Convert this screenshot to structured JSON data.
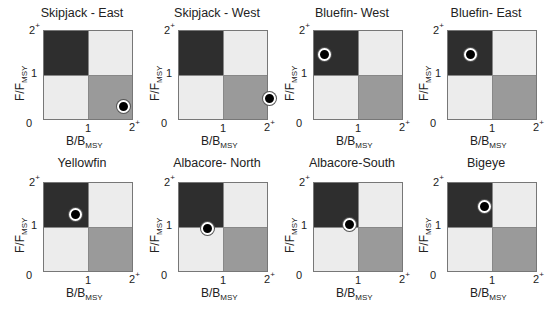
{
  "chart_data": [
    {
      "type": "scatter",
      "title": "Skipjack - East",
      "xlabel": "B/B_MSY",
      "ylabel": "F/F_MSY",
      "xlim": [
        0,
        2
      ],
      "ylim": [
        0,
        2
      ],
      "x": [
        1.76
      ],
      "y": [
        0.33
      ]
    },
    {
      "type": "scatter",
      "title": "Skipjack - West",
      "xlabel": "B/B_MSY",
      "ylabel": "F/F_MSY",
      "xlim": [
        0,
        2
      ],
      "ylim": [
        0,
        2
      ],
      "x": [
        2.0
      ],
      "y": [
        0.49
      ]
    },
    {
      "type": "scatter",
      "title": "Bluefin- West",
      "xlabel": "B/B_MSY",
      "ylabel": "F/F_MSY",
      "xlim": [
        0,
        2
      ],
      "ylim": [
        0,
        2
      ],
      "x": [
        0.24
      ],
      "y": [
        1.47
      ]
    },
    {
      "type": "scatter",
      "title": "Bluefin- East",
      "xlabel": "B/B_MSY",
      "ylabel": "F/F_MSY",
      "xlim": [
        0,
        2
      ],
      "ylim": [
        0,
        2
      ],
      "x": [
        0.51
      ],
      "y": [
        1.47
      ]
    },
    {
      "type": "scatter",
      "title": "Yellowfin",
      "xlabel": "B/B_MSY",
      "ylabel": "F/F_MSY",
      "xlim": [
        0,
        2
      ],
      "ylim": [
        0,
        2
      ],
      "x": [
        0.69
      ],
      "y": [
        1.31
      ]
    },
    {
      "type": "scatter",
      "title": "Albacore- North",
      "xlabel": "B/B_MSY",
      "ylabel": "F/F_MSY",
      "xlim": [
        0,
        2
      ],
      "ylim": [
        0,
        2
      ],
      "x": [
        0.64
      ],
      "y": [
        0.98
      ]
    },
    {
      "type": "scatter",
      "title": "Albacore-South",
      "xlabel": "B/B_MSY",
      "ylabel": "F/F_MSY",
      "xlim": [
        0,
        2
      ],
      "ylim": [
        0,
        2
      ],
      "x": [
        0.78
      ],
      "y": [
        1.07
      ]
    },
    {
      "type": "scatter",
      "title": "Bigeye",
      "xlabel": "B/B_MSY",
      "ylabel": "F/F_MSY",
      "xlim": [
        0,
        2
      ],
      "ylim": [
        0,
        2
      ],
      "x": [
        0.8
      ],
      "y": [
        1.47
      ]
    }
  ],
  "axes": {
    "x_main": "B/B",
    "x_sub": "MSY",
    "y_main": "F/F",
    "y_sub": "MSY",
    "tick_0": "0",
    "tick_1": "1",
    "tick_2": "2",
    "tick_plus": "+"
  },
  "quadrant_colors": {
    "overfished_overfishing": "#2e2e2e",
    "healthy_overfishing": "#ececec",
    "overfished_no_overfishing": "#ececec",
    "healthy": "#9a9a9a"
  },
  "panels": [
    {
      "title": "Skipjack - East"
    },
    {
      "title": "Skipjack - West"
    },
    {
      "title": "Bluefin- West"
    },
    {
      "title": "Bluefin- East"
    },
    {
      "title": "Yellowfin"
    },
    {
      "title": "Albacore- North"
    },
    {
      "title": "Albacore-South"
    },
    {
      "title": "Bigeye"
    }
  ]
}
